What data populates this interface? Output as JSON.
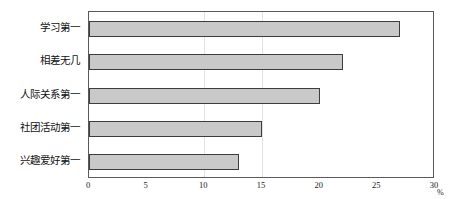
{
  "chart_data": {
    "type": "bar",
    "orientation": "horizontal",
    "title": "",
    "xlabel": "%",
    "ylabel": "",
    "categories": [
      "学习第一",
      "相差无几",
      "人际关系第一",
      "社团活动第一",
      "兴趣爱好第一"
    ],
    "values": [
      27,
      22,
      20,
      15,
      13
    ],
    "xlim": [
      0,
      30
    ],
    "xticks": [
      0,
      5,
      10,
      15,
      20,
      25,
      30
    ],
    "xtick_labels": [
      "0",
      "5",
      "10",
      "15",
      "20",
      "25",
      "30"
    ],
    "grid": true,
    "gridlines_x": [
      10,
      15
    ],
    "legend": null,
    "bar_fill_color": "#c9c9c9",
    "bar_border_color": "#3d3d3d",
    "axis_color": "#5a5a5a",
    "grid_color": "#e2e2e2",
    "background_color": "#ffffff"
  },
  "axis": {
    "unit": "%"
  }
}
